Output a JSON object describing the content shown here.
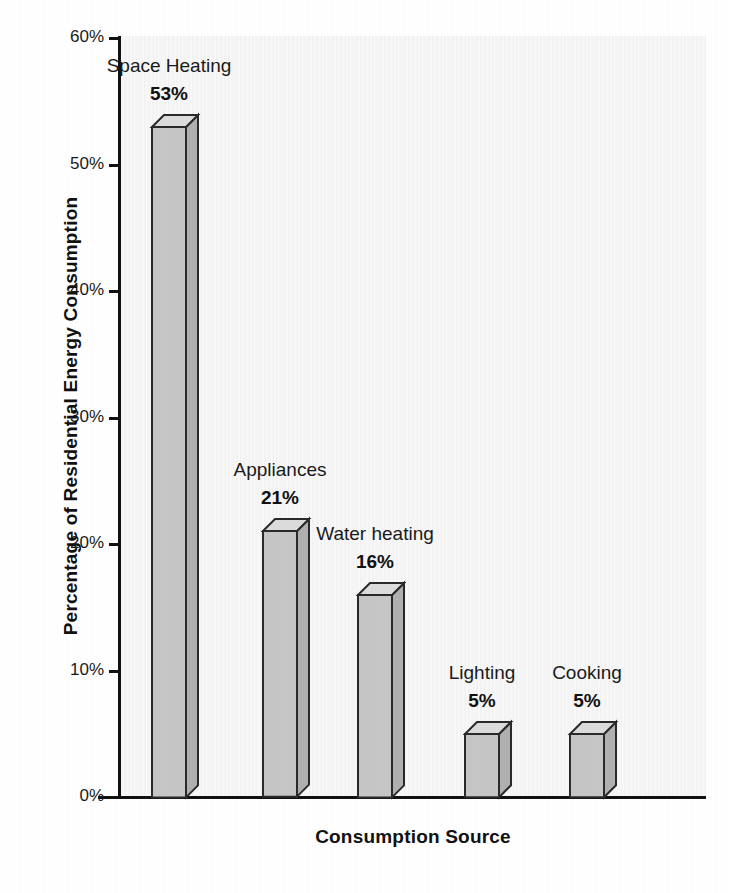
{
  "chart_data": {
    "type": "bar",
    "title": "",
    "subtitle": "",
    "xlabel": "Consumption Source",
    "ylabel": "Percentage of Residential Energy Consumption",
    "categories": [
      "Space Heating",
      "Appliances",
      "Water heating",
      "Lighting",
      "Cooking"
    ],
    "values": [
      53,
      21,
      16,
      5,
      5
    ],
    "value_labels": [
      "53%",
      "21%",
      "16%",
      "5%",
      "5%"
    ],
    "ylim": [
      0,
      60
    ],
    "ytick_values": [
      0,
      10,
      20,
      30,
      40,
      50,
      60
    ],
    "ytick_labels": [
      "0%",
      "10%",
      "20%",
      "30%",
      "40%",
      "50%",
      "60%"
    ],
    "grid": false,
    "legend": false,
    "legend_position": "none",
    "style": "3d-column",
    "colors": {
      "bar_front": "#c6c6c6",
      "bar_top": "#dcdcdc",
      "bar_side": "#b0b0b0",
      "bar_outline": "#2a2a2a",
      "axis": "#111111",
      "plot_background": "#f4f4f4",
      "page_background": "#ffffff",
      "text": "#1a1a1a"
    }
  },
  "axes": {
    "y_title": "Percentage of Residential Energy Consumption",
    "x_title": "Consumption Source"
  },
  "ticks": [
    {
      "label": "60%",
      "value": 60
    },
    {
      "label": "50%",
      "value": 50
    },
    {
      "label": "40%",
      "value": 40
    },
    {
      "label": "30%",
      "value": 30
    },
    {
      "label": "20%",
      "value": 20
    },
    {
      "label": "10%",
      "value": 10
    },
    {
      "label": "0%",
      "value": 0
    }
  ],
  "bars": [
    {
      "category": "Space Heating",
      "value": 53,
      "value_label": "53%"
    },
    {
      "category": "Appliances",
      "value": 21,
      "value_label": "21%"
    },
    {
      "category": "Water heating",
      "value": 16,
      "value_label": "16%"
    },
    {
      "category": "Lighting",
      "value": 5,
      "value_label": "5%"
    },
    {
      "category": "Cooking",
      "value": 5,
      "value_label": "5%"
    }
  ]
}
